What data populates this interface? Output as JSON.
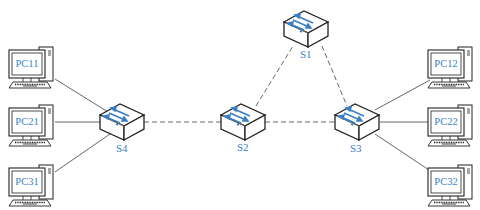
{
  "diagram": {
    "type": "network-topology",
    "colors": {
      "label": "#3a7fc4",
      "arrow": "#3a7fc4",
      "outline": "#222222",
      "link_solid": "#555555",
      "link_dashed": "#555555"
    },
    "switches": [
      {
        "id": "S1",
        "label": "S1",
        "x": 306,
        "y": 28
      },
      {
        "id": "S2",
        "label": "S2",
        "x": 243,
        "y": 121
      },
      {
        "id": "S3",
        "label": "S3",
        "x": 357,
        "y": 121
      },
      {
        "id": "S4",
        "label": "S4",
        "x": 122,
        "y": 121
      }
    ],
    "pcs": [
      {
        "id": "PC11",
        "label": "PC11",
        "side": "left",
        "row": 1
      },
      {
        "id": "PC21",
        "label": "PC21",
        "side": "left",
        "row": 2
      },
      {
        "id": "PC31",
        "label": "PC31",
        "side": "left",
        "row": 3
      },
      {
        "id": "PC12",
        "label": "PC12",
        "side": "right",
        "row": 1
      },
      {
        "id": "PC22",
        "label": "PC22",
        "side": "right",
        "row": 2
      },
      {
        "id": "PC32",
        "label": "PC32",
        "side": "right",
        "row": 3
      }
    ],
    "links": [
      {
        "from": "PC11",
        "to": "S4",
        "style": "solid"
      },
      {
        "from": "PC21",
        "to": "S4",
        "style": "solid"
      },
      {
        "from": "PC31",
        "to": "S4",
        "style": "solid"
      },
      {
        "from": "S4",
        "to": "S2",
        "style": "dashed"
      },
      {
        "from": "S2",
        "to": "S3",
        "style": "dashed"
      },
      {
        "from": "S2",
        "to": "S1",
        "style": "dashed"
      },
      {
        "from": "S1",
        "to": "S3",
        "style": "dashed"
      },
      {
        "from": "S3",
        "to": "PC12",
        "style": "solid"
      },
      {
        "from": "S3",
        "to": "PC22",
        "style": "solid"
      },
      {
        "from": "S3",
        "to": "PC32",
        "style": "solid"
      }
    ]
  },
  "labels": {
    "s1": "S1",
    "s2": "S2",
    "s3": "S3",
    "s4": "S4",
    "pc11": "PC11",
    "pc21": "PC21",
    "pc31": "PC31",
    "pc12": "PC12",
    "pc22": "PC22",
    "pc32": "PC32"
  }
}
